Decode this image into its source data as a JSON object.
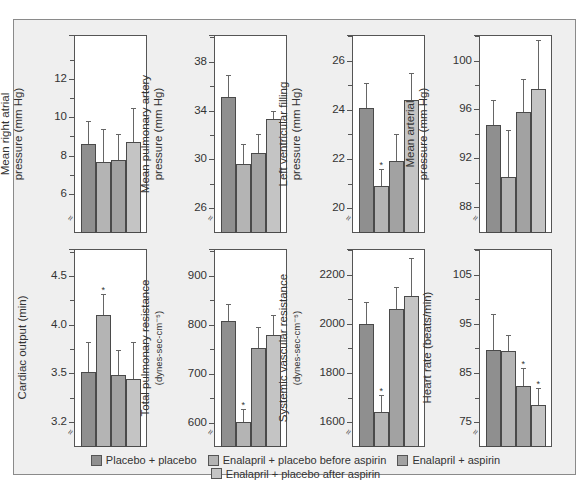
{
  "chart_data": {
    "type": "bar",
    "categories": [
      "Placebo + placebo",
      "Enalapril + placebo before aspirin",
      "Enalapril + aspirin",
      "Enalapril + placebo after aspirin"
    ],
    "legend": {
      "position": "bottom",
      "entries": [
        {
          "label": "Placebo + placebo",
          "color": "#8f8f8f"
        },
        {
          "label": "Enalapril + placebo before aspirin",
          "color": "#b4b4b4"
        },
        {
          "label": "Enalapril + aspirin",
          "color": "#a2a2a2"
        },
        {
          "label": "Enalapril + placebo after aspirin",
          "color": "#c4c4c4"
        }
      ]
    },
    "panels": [
      {
        "id": "mrap",
        "ylabel": "Mean right atrial",
        "ylabel2": "pressure (mm Hg)",
        "ylabel_sub": false,
        "ylim": [
          3.95,
          14.3
        ],
        "ticks": [
          6,
          8,
          10,
          12
        ],
        "minor_ticks": [
          7,
          9,
          11,
          13
        ],
        "values": [
          8.6,
          7.65,
          7.75,
          8.7
        ],
        "errors": [
          9.8,
          9.4,
          9.1,
          10.5
        ],
        "significant": [
          false,
          false,
          false,
          false
        ]
      },
      {
        "id": "mpap",
        "ylabel": "Mean pulmonary artery",
        "ylabel2": "pressure (mm Hg)",
        "ylabel_sub": false,
        "ylim": [
          23.96,
          40.2
        ],
        "ticks": [
          26,
          30,
          34,
          38
        ],
        "minor_ticks": [
          28,
          32,
          36,
          40
        ],
        "values": [
          35.1,
          29.6,
          30.5,
          33.3
        ],
        "errors": [
          36.9,
          31.3,
          32.1,
          34.0
        ],
        "significant": [
          false,
          false,
          false,
          false
        ]
      },
      {
        "id": "lvfp",
        "ylabel": "Left ventricular filling",
        "ylabel2": "pressure (mm Hg)",
        "ylabel_sub": false,
        "ylim": [
          18.98,
          27.06
        ],
        "ticks": [
          20,
          22,
          24,
          26
        ],
        "minor_ticks": [
          21,
          23,
          25,
          27
        ],
        "values": [
          24.1,
          20.9,
          21.9,
          24.4
        ],
        "errors": [
          25.1,
          21.6,
          23.0,
          25.5
        ],
        "significant": [
          false,
          true,
          false,
          false
        ]
      },
      {
        "id": "map",
        "ylabel": "Mean arterial",
        "ylabel2": "pressure (mm Hg)",
        "ylabel_sub": false,
        "ylim": [
          85.87,
          102.1
        ],
        "ticks": [
          88,
          92,
          96,
          100
        ],
        "minor_ticks": [
          90,
          94,
          98,
          102
        ],
        "values": [
          94.7,
          90.5,
          95.8,
          97.7
        ],
        "errors": [
          96.8,
          94.3,
          98.5,
          101.7
        ],
        "significant": [
          false,
          false,
          false,
          false
        ]
      },
      {
        "id": "co",
        "ylabel": "Cardiac output (min)",
        "ylabel2": "",
        "ylabel_sub": false,
        "ylim": [
          2.74,
          4.78
        ],
        "ticks": [
          3.2,
          3.5,
          4.0,
          4.5
        ],
        "tick_labels": [
          "3.2",
          "3.5",
          "4.0",
          "4.5"
        ],
        "minor_ticks": [
          3.25,
          3.75,
          4.25,
          4.75
        ],
        "tick_pos_override": {
          "3.2": 3.0
        },
        "values": [
          3.51,
          4.1,
          3.48,
          3.44
        ],
        "errors": [
          3.82,
          4.32,
          3.74,
          3.82
        ],
        "significant": [
          false,
          true,
          false,
          false
        ]
      },
      {
        "id": "tpr",
        "ylabel": "Total pulmonary resistance",
        "ylabel2": "(dynes-sec-cm⁻⁵)",
        "ylabel_sub": true,
        "ylim": [
          551,
          955
        ],
        "ticks": [
          600,
          700,
          800,
          900
        ],
        "minor_ticks": [
          650,
          750,
          850,
          950
        ],
        "values": [
          808,
          602,
          753,
          779
        ],
        "errors": [
          842,
          629,
          795,
          821
        ],
        "significant": [
          false,
          true,
          false,
          false
        ]
      },
      {
        "id": "svr",
        "ylabel": "Systemic vascular resistance",
        "ylabel2": "(dynes-sec-cm⁻⁵)",
        "ylabel_sub": true,
        "ylim": [
          1498,
          2306
        ],
        "ticks": [
          1600,
          1800,
          2000,
          2200
        ],
        "minor_ticks": [
          1700,
          1900,
          2100,
          2300
        ],
        "values": [
          2000,
          1642,
          2060,
          2115
        ],
        "errors": [
          2088,
          1712,
          2150,
          2270
        ],
        "significant": [
          false,
          true,
          false,
          false
        ]
      },
      {
        "id": "hr",
        "ylabel": "Heart rate (beats/min)",
        "ylabel2": "",
        "ylabel_sub": false,
        "ylim": [
          69.9,
          110.3
        ],
        "ticks": [
          75,
          85,
          95,
          105
        ],
        "minor_ticks": [
          80,
          90,
          100,
          110
        ],
        "values": [
          89.7,
          89.4,
          82.4,
          78.5
        ],
        "errors": [
          97.0,
          92.8,
          86.0,
          82.0
        ],
        "significant": [
          false,
          false,
          true,
          true
        ]
      }
    ],
    "axis_break": true,
    "grid": false
  }
}
